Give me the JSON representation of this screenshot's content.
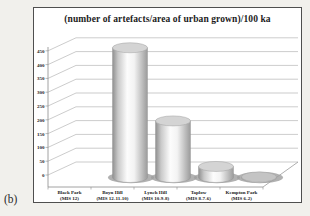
{
  "figure": {
    "panel_label": "(b)"
  },
  "chart_data": {
    "type": "bar",
    "subtype": "3d-cylinder",
    "title": "(number of artefacts/area of urban grown)/100 ka",
    "categories": [
      {
        "name": "Black Park",
        "mis": "(MIS 12)"
      },
      {
        "name": "Boyn Hill",
        "mis": "(MIS 12-11-10)"
      },
      {
        "name": "Lynch Hill",
        "mis": "(MIS 10-9-8)"
      },
      {
        "name": "Taplow",
        "mis": "(MIS 8-7-6)"
      },
      {
        "name": "Kempton Park",
        "mis": "(MIS 6-2)"
      }
    ],
    "values": [
      0,
      470,
      205,
      40,
      2
    ],
    "xlabel": "",
    "ylabel": "",
    "yticks": [
      0,
      50,
      100,
      150,
      200,
      250,
      300,
      350,
      400,
      450
    ],
    "ylim": [
      0,
      450
    ],
    "grid": true,
    "legend": "none",
    "colors": {
      "page_bg": "#f1f0ec",
      "chart_bg": "#ffffff",
      "border": "#4f4f4f",
      "gridline": "#a9a9a9",
      "axis": "#8c8c8c",
      "cylinder_light": "#fcfcfc",
      "cylinder_dark": "#8f8f8f",
      "cylinder_top": "#d4d4d4",
      "shadow": "#9e9e9e",
      "text": "#1c1c1c"
    }
  }
}
